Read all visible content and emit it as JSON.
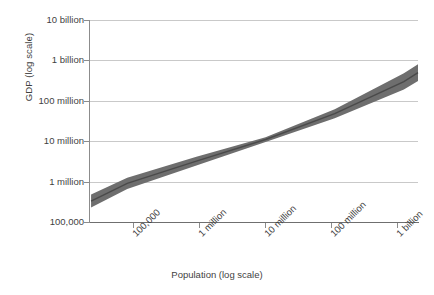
{
  "chart_data": {
    "type": "line",
    "title": "",
    "subtitle": "",
    "xlabel": "Population (log scale)",
    "ylabel": "GDP (log scale)",
    "grid": true,
    "legend": "none",
    "x_scale": "log",
    "y_scale": "log",
    "x_tick_labels": [
      "100,000",
      "1 million",
      "10 million",
      "100 million",
      "1 billion"
    ],
    "x_tick_values": [
      100000,
      1000000,
      10000000,
      100000000,
      1000000000
    ],
    "y_tick_labels": [
      "10 billion",
      "1 billion",
      "100 million",
      "10 million",
      "1 million",
      "100,000"
    ],
    "y_tick_values": [
      10000000000,
      1000000000,
      100000000,
      10000000,
      1000000,
      100000
    ],
    "xlim": [
      28000,
      1600000000
    ],
    "ylim": [
      100000,
      10000000000
    ],
    "series": [
      {
        "name": "fitted regression line",
        "kind": "line",
        "color": "#4a4a4a",
        "x": [
          30000,
          100000,
          1000000,
          10000000,
          100000000,
          1000000000,
          1600000000
        ],
        "y": [
          330000,
          900000,
          3200000,
          11000000,
          48000000,
          300000000,
          500000000
        ]
      },
      {
        "name": "confidence band",
        "kind": "band",
        "color": "#6e6e6e",
        "x": [
          30000,
          100000,
          1000000,
          10000000,
          100000000,
          1000000000,
          1600000000
        ],
        "y_upper": [
          480000,
          1250000,
          4100000,
          12500000,
          62000000,
          480000000,
          800000000
        ],
        "y_lower": [
          230000,
          660000,
          2500000,
          9600000,
          37000000,
          190000000,
          310000000
        ]
      }
    ],
    "annotations": []
  },
  "axes": {
    "y_title": "GDP (log scale)",
    "x_title": "Population (log scale)",
    "y_ticks": [
      {
        "label": "10 billion",
        "y": 20
      },
      {
        "label": "1 billion",
        "y": 60
      },
      {
        "label": "100 million",
        "y": 101
      },
      {
        "label": "10 million",
        "y": 141
      },
      {
        "label": "1 million",
        "y": 182
      },
      {
        "label": "100,000",
        "y": 222
      }
    ],
    "x_ticks": [
      {
        "label": "100,000",
        "x": 133
      },
      {
        "label": "1 million",
        "x": 199
      },
      {
        "label": "10 million",
        "x": 265
      },
      {
        "label": "100 million",
        "x": 331
      },
      {
        "label": "1 billion",
        "x": 397
      }
    ]
  },
  "colors": {
    "background": "#ffffff",
    "gridline": "#c9c9c9",
    "axis": "#8c8c8c",
    "band_fill": "#6e6e6e",
    "line": "#434343",
    "text": "#3f3f3f"
  }
}
